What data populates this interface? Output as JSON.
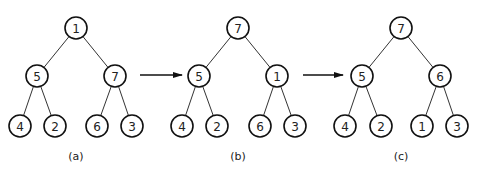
{
  "figure": {
    "type": "heap-transformation",
    "node_radius": 11,
    "trees": [
      {
        "id": "a",
        "caption": "(a)",
        "caption_pos": [
          76,
          156
        ],
        "nodes": [
          {
            "label": "1",
            "x": 76,
            "y": 28
          },
          {
            "label": "5",
            "x": 37,
            "y": 76
          },
          {
            "label": "7",
            "x": 115,
            "y": 76
          },
          {
            "label": "4",
            "x": 20,
            "y": 126
          },
          {
            "label": "2",
            "x": 55,
            "y": 126
          },
          {
            "label": "6",
            "x": 97,
            "y": 126
          },
          {
            "label": "3",
            "x": 132,
            "y": 126
          }
        ],
        "edges": [
          [
            0,
            1
          ],
          [
            0,
            2
          ],
          [
            1,
            3
          ],
          [
            1,
            4
          ],
          [
            2,
            5
          ],
          [
            2,
            6
          ]
        ]
      },
      {
        "id": "b",
        "caption": "(b)",
        "caption_pos": [
          238,
          156
        ],
        "nodes": [
          {
            "label": "7",
            "x": 238,
            "y": 28
          },
          {
            "label": "5",
            "x": 199,
            "y": 76
          },
          {
            "label": "1",
            "x": 277,
            "y": 76
          },
          {
            "label": "4",
            "x": 182,
            "y": 126
          },
          {
            "label": "2",
            "x": 217,
            "y": 126
          },
          {
            "label": "6",
            "x": 260,
            "y": 126
          },
          {
            "label": "3",
            "x": 295,
            "y": 126
          }
        ],
        "edges": [
          [
            0,
            1
          ],
          [
            0,
            2
          ],
          [
            1,
            3
          ],
          [
            1,
            4
          ],
          [
            2,
            5
          ],
          [
            2,
            6
          ]
        ]
      },
      {
        "id": "c",
        "caption": "(c)",
        "caption_pos": [
          401,
          156
        ],
        "nodes": [
          {
            "label": "7",
            "x": 401,
            "y": 28
          },
          {
            "label": "5",
            "x": 362,
            "y": 76
          },
          {
            "label": "6",
            "x": 440,
            "y": 76
          },
          {
            "label": "4",
            "x": 345,
            "y": 126
          },
          {
            "label": "2",
            "x": 381,
            "y": 126
          },
          {
            "label": "1",
            "x": 422,
            "y": 126
          },
          {
            "label": "3",
            "x": 457,
            "y": 126
          }
        ],
        "edges": [
          [
            0,
            1
          ],
          [
            0,
            2
          ],
          [
            1,
            3
          ],
          [
            1,
            4
          ],
          [
            2,
            5
          ],
          [
            2,
            6
          ]
        ]
      }
    ],
    "arrows": [
      {
        "from": [
          140,
          75
        ],
        "to": [
          182,
          75
        ]
      },
      {
        "from": [
          303,
          75
        ],
        "to": [
          343,
          75
        ]
      }
    ],
    "colors": {
      "stroke": "#111111",
      "edge": "#333333",
      "text": "#222222",
      "background": "#ffffff"
    }
  }
}
